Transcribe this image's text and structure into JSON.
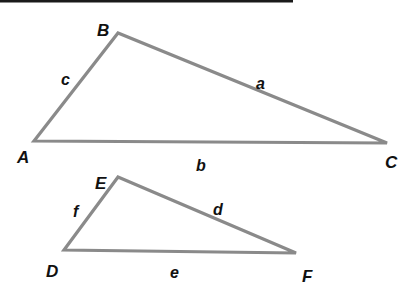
{
  "diagram": {
    "type": "two-triangles",
    "colors": {
      "line": "#8a8a8a",
      "text": "#111111",
      "rule": "#1a1a1a",
      "background": "#ffffff"
    },
    "top_rule": {
      "x1": 0,
      "x2": 293,
      "y": 1
    },
    "triangles": [
      {
        "name": "ABC",
        "vertices": {
          "A": {
            "label": "A",
            "x": 34,
            "y": 141
          },
          "B": {
            "label": "B",
            "x": 118,
            "y": 33
          },
          "C": {
            "label": "C",
            "x": 387,
            "y": 143
          }
        },
        "sides": {
          "a": {
            "label": "a",
            "between": "B-C"
          },
          "b": {
            "label": "b",
            "between": "A-C"
          },
          "c": {
            "label": "c",
            "between": "A-B"
          }
        }
      },
      {
        "name": "DEF",
        "vertices": {
          "D": {
            "label": "D",
            "x": 64,
            "y": 250
          },
          "E": {
            "label": "E",
            "x": 118,
            "y": 177
          },
          "F": {
            "label": "F",
            "x": 296,
            "y": 253
          }
        },
        "sides": {
          "d": {
            "label": "d",
            "between": "E-F"
          },
          "e": {
            "label": "e",
            "between": "D-F"
          },
          "f": {
            "label": "f",
            "between": "D-E"
          }
        }
      }
    ]
  }
}
